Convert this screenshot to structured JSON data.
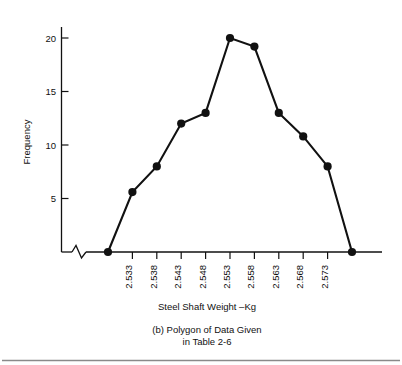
{
  "figure": {
    "label": "(b)",
    "caption_line1": "(b)  Polygon of Data Given",
    "caption_line2": "in Table 2-6",
    "bottom_rule": true
  },
  "chart_data": {
    "type": "line",
    "title": "",
    "subtitle": "",
    "xlabel": "Steel Shaft Weight –Kg",
    "ylabel": "Frequency",
    "grid": false,
    "legend": null,
    "axis_break_x": true,
    "categories": [
      "2.528",
      "2.533",
      "2.538",
      "2.543",
      "2.548",
      "2.553",
      "2.558",
      "2.563",
      "2.568",
      "2.573",
      "2.578"
    ],
    "x_tick_labels": [
      "2.533",
      "2.538",
      "2.543",
      "2.548",
      "2.553",
      "2.558",
      "2.563",
      "2.568",
      "2.573"
    ],
    "x_tick_label_rotation": -90,
    "y_tick_labels": [
      "5",
      "10",
      "15",
      "20"
    ],
    "y_ticks": [
      5,
      10,
      15,
      20
    ],
    "ylim": [
      0,
      21.5
    ],
    "values": [
      0,
      5.6,
      8,
      12,
      13,
      20,
      19.2,
      13,
      10.8,
      8,
      0
    ],
    "points": [
      {
        "x": "2.528",
        "y": 0
      },
      {
        "x": "2.533",
        "y": 5.6
      },
      {
        "x": "2.538",
        "y": 8
      },
      {
        "x": "2.543",
        "y": 12
      },
      {
        "x": "2.548",
        "y": 13
      },
      {
        "x": "2.553",
        "y": 20
      },
      {
        "x": "2.558",
        "y": 19.2
      },
      {
        "x": "2.563",
        "y": 13
      },
      {
        "x": "2.568",
        "y": 10.8
      },
      {
        "x": "2.573",
        "y": 8
      },
      {
        "x": "2.578",
        "y": 0
      }
    ],
    "series": [
      {
        "name": "Frequency",
        "values": [
          0,
          5.6,
          8,
          12,
          13,
          20,
          19.2,
          13,
          10.8,
          8,
          0
        ]
      }
    ],
    "colors": {
      "line": "#111111",
      "marker": "#111111",
      "axis": "#111111",
      "background": "#ffffff"
    }
  }
}
